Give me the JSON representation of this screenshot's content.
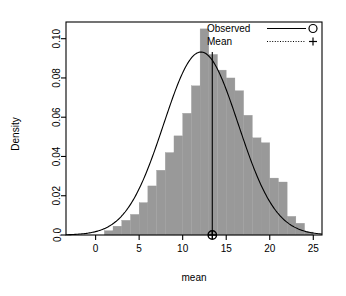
{
  "chart_data": {
    "type": "bar",
    "title": "",
    "subtitle": "",
    "xlabel": "mean",
    "ylabel": "Density",
    "xlim": [
      -3.4,
      26.0
    ],
    "ylim": [
      0.0,
      0.1085
    ],
    "grid": false,
    "legend_position": "top-right",
    "xticks": [
      0,
      5,
      10,
      15,
      20,
      25
    ],
    "xtick_labels": [
      "0",
      "5",
      "10",
      "15",
      "20",
      "25"
    ],
    "yticks": [
      0.0,
      0.02,
      0.04,
      0.06,
      0.08,
      0.1
    ],
    "ytick_labels": [
      "0.0",
      "0.02",
      "0.04",
      "0.06",
      "0.08",
      "0.10"
    ],
    "bar_color": "#999999",
    "line_color": "#000000",
    "bin_width": 1,
    "bin_starts": [
      1,
      2,
      3,
      4,
      5,
      6,
      7,
      8,
      9,
      10,
      11,
      12,
      13,
      14,
      15,
      16,
      17,
      18,
      19,
      20,
      21,
      22,
      23,
      24
    ],
    "values": [
      0.0022,
      0.0045,
      0.0075,
      0.0105,
      0.0165,
      0.025,
      0.033,
      0.042,
      0.0505,
      0.062,
      0.076,
      0.105,
      0.092,
      0.084,
      0.08,
      0.0735,
      0.061,
      0.0495,
      0.047,
      0.029,
      0.027,
      0.0095,
      0.006,
      0.0015
    ],
    "density_curve": {
      "name": "Observed",
      "distribution": "normal",
      "mu": 12.1,
      "sigma": 4.28,
      "peak_density": 0.0932
    },
    "mean_marker": {
      "name": "Mean",
      "x": 13.4,
      "y": 0.0,
      "line_top_density": 0.0932
    },
    "legend": [
      {
        "label": "Observed",
        "line_style": "solid",
        "marker": "circle"
      },
      {
        "label": "Mean",
        "line_style": "dotted",
        "marker": "plus"
      }
    ]
  },
  "legend_labels": {
    "observed": "Observed",
    "mean": "Mean"
  },
  "axis_labels": {
    "x": "mean",
    "y": "Density"
  }
}
